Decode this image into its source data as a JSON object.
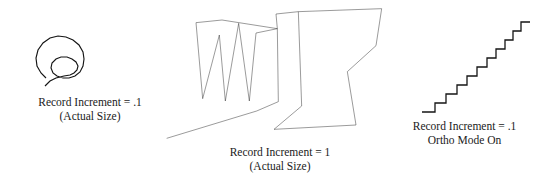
{
  "page": {
    "background_color": "#ffffff",
    "ink_color": "#151515",
    "width": 533,
    "height": 182
  },
  "figures": [
    {
      "id": "spiral",
      "name": "freehand-spiral-drawing",
      "caption": {
        "line1": "Record Increment = .1",
        "line2": "(Actual Size)"
      }
    },
    {
      "id": "polygon",
      "name": "freehand-zigzag-polygon-drawing",
      "caption": {
        "line1": "Record Increment = 1",
        "line2": "(Actual Size)"
      }
    },
    {
      "id": "stairs",
      "name": "orthogonal-staircase-drawing",
      "caption": {
        "line1": "Record Increment = .1",
        "line2": "Ortho Mode On"
      }
    }
  ],
  "geometry": {
    "spiral_path": "M 45 88 L 57 79 L 71 77 L 75 72 L 70 66 L 61 65 L 54 70 L 54 78 L 61 84 L 73 85 L 82 78 L 84 66 L 80 54 L 71 47 L 60 45 L 50 49 L 43 57 L 41 67 L 44 76 L 50 82",
    "polygon_outline_path": "M 20 415 L 290 333 L 355 305 L 352 86 L 186 60 L 108 68 L 128 296 L 178 105 L 196 303 L 236 70 L 268 303 L 288 99 L 352 86 L 348 42 L 415 35 L 665 26 L 648 137 L 562 215 L 588 375 L 342 388 L 425 318 L 415 35",
    "stairs_path": "M 8 104 L 20 104 L 20 93 L 32 93 L 32 82 L 44 82 L 44 71 L 56 71 L 56 60 L 68 60 L 68 49 L 80 49 L 80 38 L 92 38 L 92 27 L 104 27 L 104 16 L 116 16"
  }
}
